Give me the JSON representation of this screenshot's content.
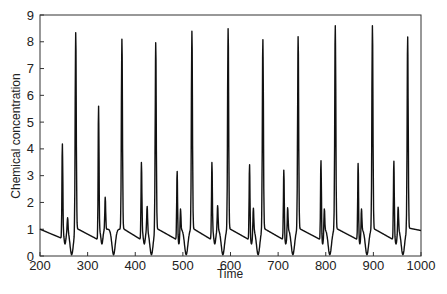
{
  "chart_data": {
    "type": "line",
    "title": "",
    "xlabel": "Time",
    "ylabel": "Chemical concentration",
    "xlim": [
      200,
      1000
    ],
    "ylim": [
      0,
      9
    ],
    "xticks": [
      200,
      300,
      400,
      500,
      600,
      700,
      800,
      900,
      1000
    ],
    "yticks": [
      0,
      1,
      2,
      3,
      4,
      5,
      6,
      7,
      8,
      9
    ],
    "grid": false,
    "legend": null,
    "peaks": [
      {
        "x": 247,
        "y": 4.2
      },
      {
        "x": 258,
        "y": 1.5
      },
      {
        "x": 275,
        "y": 8.4
      },
      {
        "x": 323,
        "y": 5.6
      },
      {
        "x": 337,
        "y": 2.2
      },
      {
        "x": 372,
        "y": 8.1
      },
      {
        "x": 413,
        "y": 3.5
      },
      {
        "x": 425,
        "y": 1.9
      },
      {
        "x": 443,
        "y": 8.0
      },
      {
        "x": 488,
        "y": 3.3
      },
      {
        "x": 495,
        "y": 1.9
      },
      {
        "x": 519,
        "y": 8.4
      },
      {
        "x": 561,
        "y": 3.5
      },
      {
        "x": 573,
        "y": 1.9
      },
      {
        "x": 595,
        "y": 8.5
      },
      {
        "x": 640,
        "y": 3.5
      },
      {
        "x": 648,
        "y": 1.9
      },
      {
        "x": 668,
        "y": 8.1
      },
      {
        "x": 712,
        "y": 3.3
      },
      {
        "x": 720,
        "y": 1.9
      },
      {
        "x": 742,
        "y": 8.2
      },
      {
        "x": 790,
        "y": 3.7
      },
      {
        "x": 797,
        "y": 1.9
      },
      {
        "x": 820,
        "y": 8.6
      },
      {
        "x": 868,
        "y": 3.6
      },
      {
        "x": 875,
        "y": 1.9
      },
      {
        "x": 898,
        "y": 8.6
      },
      {
        "x": 943,
        "y": 3.6
      },
      {
        "x": 952,
        "y": 1.9
      },
      {
        "x": 972,
        "y": 8.2
      }
    ],
    "baseline_level": 1.0,
    "trough_level": 0.0
  }
}
